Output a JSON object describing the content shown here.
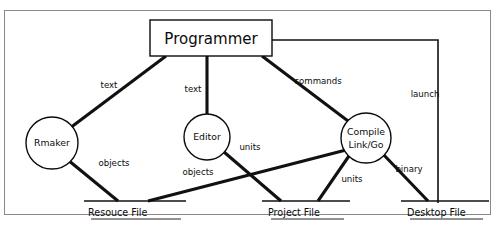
{
  "diagram": {
    "title_node": {
      "label": "Programmer",
      "shape": "rectangle"
    },
    "process_nodes": [
      {
        "id": "rmaker",
        "label": "Rmaker",
        "shape": "circle"
      },
      {
        "id": "editor",
        "label": "Editor",
        "shape": "circle"
      },
      {
        "id": "compile",
        "label_line1": "Compile",
        "label_line2": "Link/Go",
        "shape": "circle"
      }
    ],
    "data_stores": [
      {
        "id": "resource-file",
        "label": "Resouce File"
      },
      {
        "id": "project-file",
        "label": "Project File"
      },
      {
        "id": "desktop-file",
        "label": "Desktop File"
      }
    ],
    "edge_labels": {
      "programmer_to_rmaker": "text",
      "programmer_to_editor": "text",
      "programmer_to_compile": "commands",
      "programmer_to_desktop": "launch",
      "rmaker_to_resource": "objects",
      "editor_to_resource": "objects",
      "editor_to_project": "units",
      "compile_to_project_left": "units",
      "compile_to_project_right": "units",
      "compile_to_desktop": "binary"
    }
  },
  "colors": {
    "ink": "#0b0b0b",
    "line": "#111111",
    "frame": "#8a8a8a",
    "background": "#ffffff"
  }
}
